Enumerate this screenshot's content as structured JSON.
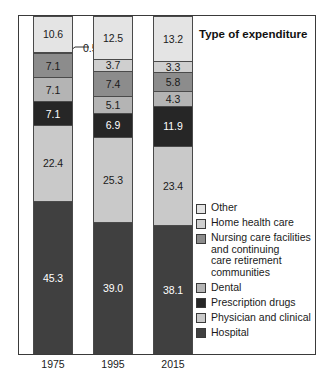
{
  "title": "Type of expenditure",
  "annotation": {
    "label": "0.5",
    "refers_to_year": "1975",
    "refers_to_category": "Home health care"
  },
  "legend": {
    "position": "right",
    "items": [
      {
        "label": "Other",
        "lines": [
          "Other"
        ],
        "color": "#e4e4e4"
      },
      {
        "label": "Home health care",
        "lines": [
          "Home health care"
        ],
        "color": "#cfcfcf"
      },
      {
        "label": "Nursing care facilities and continuing care retirement communities",
        "lines": [
          "Nursing care facilities",
          "and continuing",
          "care retirement",
          "communities"
        ],
        "color": "#8c8c8c"
      },
      {
        "label": "Dental",
        "lines": [
          "Dental"
        ],
        "color": "#b4b4b4"
      },
      {
        "label": "Prescription drugs",
        "lines": [
          "Prescription drugs"
        ],
        "color": "#262626"
      },
      {
        "label": "Physician and clinical",
        "lines": [
          "Physician and clinical"
        ],
        "color": "#c9c9c9"
      },
      {
        "label": "Hospital",
        "lines": [
          "Hospital"
        ],
        "color": "#404040"
      }
    ]
  },
  "chart_data": {
    "type": "bar",
    "subtype": "stacked-vertical-100percent",
    "title": "Type of expenditure",
    "xlabel": "",
    "ylabel": "",
    "ylim": [
      0,
      100
    ],
    "grid": false,
    "legend_position": "right",
    "categories": [
      "1975",
      "1995",
      "2015"
    ],
    "series": [
      {
        "name": "Hospital",
        "color": "#404040",
        "label_color": "light",
        "values": [
          45.3,
          39.0,
          38.1
        ]
      },
      {
        "name": "Physician and clinical",
        "color": "#c9c9c9",
        "label_color": "dark",
        "values": [
          22.4,
          25.3,
          23.4
        ]
      },
      {
        "name": "Prescription drugs",
        "color": "#262626",
        "label_color": "light",
        "values": [
          7.1,
          6.9,
          11.9
        ]
      },
      {
        "name": "Dental",
        "color": "#b4b4b4",
        "label_color": "dark",
        "values": [
          7.1,
          5.1,
          4.3
        ]
      },
      {
        "name": "Nursing care facilities and continuing care retirement communities",
        "color": "#8c8c8c",
        "label_color": "dark",
        "values": [
          7.1,
          7.4,
          5.8
        ]
      },
      {
        "name": "Home health care",
        "color": "#cfcfcf",
        "label_color": "dark",
        "values": [
          0.5,
          3.7,
          3.3
        ]
      },
      {
        "name": "Other",
        "color": "#e4e4e4",
        "label_color": "dark",
        "values": [
          10.6,
          12.5,
          13.2
        ]
      }
    ],
    "annotations": [
      {
        "text": "0.5",
        "series": "Home health care",
        "category": "1975",
        "leader_line": true
      }
    ]
  }
}
